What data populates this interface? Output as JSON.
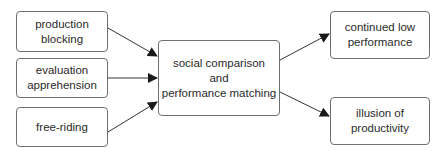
{
  "diagram": {
    "inputs": [
      {
        "id": "production-blocking",
        "lines": [
          "production",
          "blocking"
        ]
      },
      {
        "id": "evaluation-apprehension",
        "lines": [
          "evaluation",
          "apprehension"
        ]
      },
      {
        "id": "free-riding",
        "lines": [
          "free-riding"
        ]
      }
    ],
    "center": {
      "id": "social-comparison",
      "lines": [
        "social comparison",
        "and",
        "performance matching"
      ]
    },
    "outputs": [
      {
        "id": "continued-low-performance",
        "lines": [
          "continued low",
          "performance"
        ]
      },
      {
        "id": "illusion-of-productivity",
        "lines": [
          "illusion of",
          "productivity"
        ]
      }
    ],
    "edges": [
      {
        "from": "production-blocking",
        "to": "social-comparison"
      },
      {
        "from": "evaluation-apprehension",
        "to": "social-comparison"
      },
      {
        "from": "free-riding",
        "to": "social-comparison"
      },
      {
        "from": "social-comparison",
        "to": "continued-low-performance"
      },
      {
        "from": "social-comparison",
        "to": "illusion-of-productivity"
      }
    ],
    "colors": {
      "border": "#6f6f6f",
      "arrow": "#2a2a2a",
      "text": "#2a2a2a"
    }
  }
}
